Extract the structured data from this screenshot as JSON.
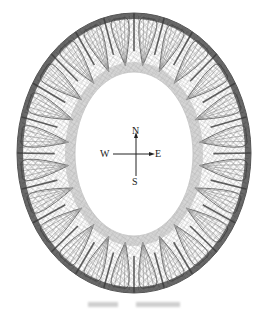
{
  "figure": {
    "type": "ring-mesh-diagram",
    "outer_ellipse": {
      "cx": 134,
      "cy": 153,
      "rx": 117,
      "ry": 140
    },
    "inner_ellipse": {
      "cx": 134,
      "cy": 154,
      "rx": 59,
      "ry": 82
    },
    "petal_count": 24,
    "colors": {
      "mesh_dark": "#3a3a3a",
      "mesh_mid": "#7a7a7a",
      "mesh_light": "#b5b5b5",
      "background": "#ffffff"
    }
  },
  "compass": {
    "north": "N",
    "south": "S",
    "east": "E",
    "west": "W",
    "center": {
      "x": 136,
      "y": 154
    }
  }
}
